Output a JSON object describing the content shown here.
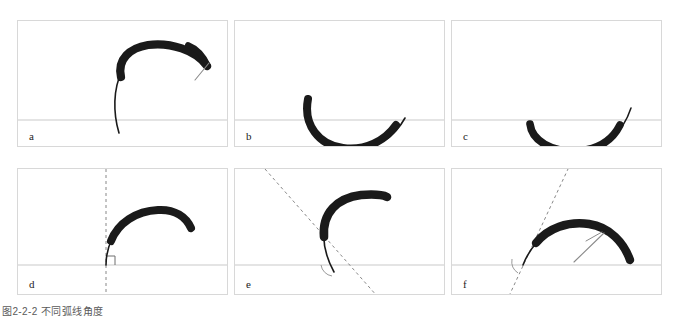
{
  "figure": {
    "caption": "图2-2-2 不同弧线角度",
    "background_color": "#ffffff",
    "panel_border_color": "#d8d8d8",
    "baseline_color": "#c9c9c9",
    "stroke_color": "#1a1a1a",
    "guide_color": "#7a7a7a",
    "panel_width": 211,
    "panel_height": 127,
    "rows": 2,
    "columns": 3
  },
  "panels": [
    {
      "id": "a",
      "label": "a",
      "row": 1,
      "column": 1,
      "x": 0,
      "y": 0,
      "baseline_y": 99,
      "description": "thick brush arc sweeping from lower-left up and over to the right with a thin tapered hook at the end",
      "stroke_path": "M 101 112 C 93 70 103 38 128 28 C 152 18 180 27 189 45",
      "stroke_widths": [
        1.2,
        9.0,
        5.0
      ],
      "tail_path": "M 189 44 L 178 58",
      "has_guide_line": false,
      "has_right_angle_marker": false,
      "has_angle_arc": false,
      "has_tangent_hook": true
    },
    {
      "id": "b",
      "label": "b",
      "row": 1,
      "column": 2,
      "x": 217,
      "y": 0,
      "baseline_y": 99,
      "description": "deep bowl shaped stroke dipping well below the baseline",
      "stroke_path": "M 73 76 C 67 106 83 126 107 128 C 133 130 157 117 165 100",
      "stroke_widths": [
        5.0,
        8.5,
        1.0
      ],
      "tail_path": "",
      "has_guide_line": false,
      "has_right_angle_marker": false,
      "has_angle_arc": false,
      "has_tangent_hook": false
    },
    {
      "id": "c",
      "label": "c",
      "row": 1,
      "column": 3,
      "x": 434,
      "y": 0,
      "baseline_y": 99,
      "description": "shallow bowl shaped stroke resting just below the baseline",
      "stroke_path": "M 78 102 C 80 120 100 130 124 129 C 148 128 166 114 173 90",
      "stroke_widths": [
        5.5,
        8.0,
        1.0
      ],
      "tail_path": "",
      "has_guide_line": false,
      "has_right_angle_marker": false,
      "has_angle_arc": false,
      "has_tangent_hook": false
    },
    {
      "id": "d",
      "label": "d",
      "row": 2,
      "column": 1,
      "x": 0,
      "y": 148,
      "baseline_y": 96,
      "description": "arc rising vertically from the baseline then arching right, with vertical dashed guide and right angle marker",
      "stroke_path": "M 88 96 C 89 70 112 47 140 45 C 157 44 168 50 172 58",
      "stroke_widths": [
        1.0,
        8.5,
        5.0
      ],
      "tail_path": "",
      "guide_line": {
        "x1": 88,
        "y1": 8,
        "x2": 88,
        "y2": 125
      },
      "has_guide_line": true,
      "has_right_angle_marker": true,
      "has_angle_arc": false,
      "has_tangent_hook": false
    },
    {
      "id": "e",
      "label": "e",
      "row": 2,
      "column": 2,
      "x": 217,
      "y": 148,
      "baseline_y": 96,
      "description": "arc leaning back with a steep dashed tangent sloping down to the right and an angle arc at the baseline",
      "stroke_path": "M 98 100 C 86 72 96 40 124 32 C 139 28 150 28 152 29",
      "stroke_widths": [
        1.0,
        9.0,
        8.0
      ],
      "tail_path": "",
      "guide_line": {
        "x1": 35,
        "y1": 3,
        "x2": 135,
        "y2": 126
      },
      "has_guide_line": true,
      "has_right_angle_marker": false,
      "has_angle_arc": true,
      "has_tangent_hook": false
    },
    {
      "id": "f",
      "label": "f",
      "row": 2,
      "column": 3,
      "x": 434,
      "y": 148,
      "baseline_y": 96,
      "description": "broad arch with a dashed tangent sloping up to the right, an angle arc at the baseline and a thin tangent hook on the stroke",
      "stroke_path": "M 72 96 C 82 72 110 56 136 58 C 158 60 172 74 178 90",
      "stroke_widths": [
        1.0,
        9.0,
        6.0
      ],
      "tail_path": "M 125 90 L 152 66",
      "guide_line": {
        "x1": 62,
        "y1": 125,
        "x2": 113,
        "y2": 8
      },
      "has_guide_line": true,
      "has_right_angle_marker": false,
      "has_angle_arc": true,
      "has_tangent_hook": true
    }
  ]
}
